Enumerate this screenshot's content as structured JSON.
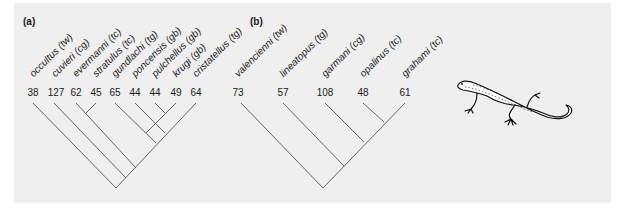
{
  "figure": {
    "panels": [
      {
        "label": "(a)",
        "taxa": [
          {
            "name": "occultus (tw)",
            "count": "38"
          },
          {
            "name": "cuvieri (cg)",
            "count": "127"
          },
          {
            "name": "evermanni (tc)",
            "count": "62"
          },
          {
            "name": "stratulus (tc)",
            "count": "45"
          },
          {
            "name": "gundlachi (tg)",
            "count": "65"
          },
          {
            "name": "poncensis (gb)",
            "count": "44"
          },
          {
            "name": "pulchellus (gb)",
            "count": "44"
          },
          {
            "name": "krugi (gb)",
            "count": "49"
          },
          {
            "name": "cristatellus (tg)",
            "count": "64"
          }
        ]
      },
      {
        "label": "(b)",
        "taxa": [
          {
            "name": "valencienni (tw)",
            "count": "73"
          },
          {
            "name": "lineatopus (tg)",
            "count": "57"
          },
          {
            "name": "garmani (cg)",
            "count": "108"
          },
          {
            "name": "opalinus (tc)",
            "count": "48"
          },
          {
            "name": "grahami (tc)",
            "count": "61"
          }
        ]
      }
    ],
    "illustration": "lizard-drawing"
  }
}
